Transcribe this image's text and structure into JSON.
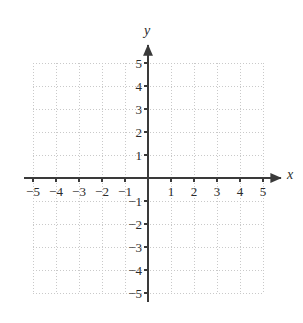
{
  "figure": {
    "kind": "cartesian-coordinate-grid",
    "width": 303,
    "height": 323,
    "background_color": "#ffffff"
  },
  "axes": {
    "x_name": "x",
    "y_name": "y",
    "axis_color": "#3a3a3a",
    "grid_color": "#c9c9c9",
    "label_color": "#2b2b2b",
    "origin_label": ""
  },
  "chart_data": {
    "type": "scatter",
    "title": "",
    "xlabel": "x",
    "ylabel": "y",
    "xlim": [
      -5,
      5
    ],
    "ylim": [
      -5,
      5
    ],
    "grid": true,
    "grid_step": 1,
    "legend": null,
    "series": [],
    "x_tick_labels": [
      "−5",
      "−4",
      "−3",
      "−2",
      "−1",
      "1",
      "2",
      "3",
      "4",
      "5"
    ],
    "x_tick_values": [
      -5,
      -4,
      -3,
      -2,
      -1,
      1,
      2,
      3,
      4,
      5
    ],
    "y_tick_labels": [
      "5",
      "4",
      "3",
      "2",
      "1",
      "−1",
      "−2",
      "−3",
      "−4",
      "−5"
    ],
    "y_tick_values": [
      5,
      4,
      3,
      2,
      1,
      -1,
      -2,
      -3,
      -4,
      -5
    ]
  }
}
